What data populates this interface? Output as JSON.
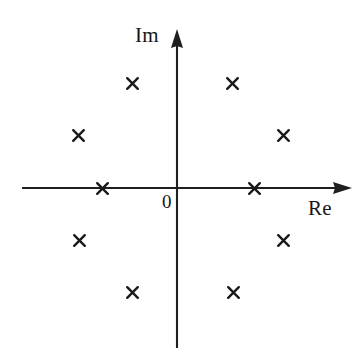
{
  "figure": {
    "title": "",
    "background_color": "#ffffff",
    "ink_color": "#1a1a1a"
  },
  "axes": {
    "horizontal": {
      "name": "real-axis",
      "label": "Re",
      "arrow": "right",
      "origin_label": "0"
    },
    "vertical": {
      "name": "imaginary-axis",
      "label": "Im",
      "arrow": "up"
    }
  },
  "chart_data": {
    "type": "scatter",
    "title": "",
    "subtitle": "",
    "xlabel": "Re",
    "ylabel": "Im",
    "xlim": [
      -1.75,
      1.75
    ],
    "ylim": [
      -1.75,
      1.75
    ],
    "grid": false,
    "legend": null,
    "annotations": [
      {
        "text": "0",
        "x": -0.12,
        "y": -0.16,
        "name": "origin-label"
      },
      {
        "text": "Re",
        "x": 1.72,
        "y": -0.22,
        "name": "re-axis-label"
      },
      {
        "text": "Im",
        "x": -0.35,
        "y": 1.75,
        "name": "im-axis-label"
      }
    ],
    "series": [
      {
        "name": "poles",
        "marker": "x",
        "marker_label": "cross-marker",
        "color": "#1a1a1a",
        "points": [
          {
            "x": -0.98,
            "y": 0.0,
            "px": 102,
            "py": 188
          },
          {
            "x": 1.0,
            "y": 0.0,
            "px": 254,
            "py": 188
          },
          {
            "x": -0.59,
            "y": 1.37,
            "px": 132,
            "py": 83
          },
          {
            "x": 0.72,
            "y": 1.37,
            "px": 232,
            "py": 83
          },
          {
            "x": -1.3,
            "y": 0.69,
            "px": 78,
            "py": 135
          },
          {
            "x": 1.39,
            "y": 0.69,
            "px": 283,
            "py": 135
          },
          {
            "x": -1.29,
            "y": -0.68,
            "px": 79,
            "py": 240
          },
          {
            "x": 1.39,
            "y": -0.68,
            "px": 283,
            "py": 240
          },
          {
            "x": -0.59,
            "y": -1.37,
            "px": 132,
            "py": 292
          },
          {
            "x": 0.73,
            "y": -1.37,
            "px": 233,
            "py": 292
          }
        ]
      }
    ]
  }
}
